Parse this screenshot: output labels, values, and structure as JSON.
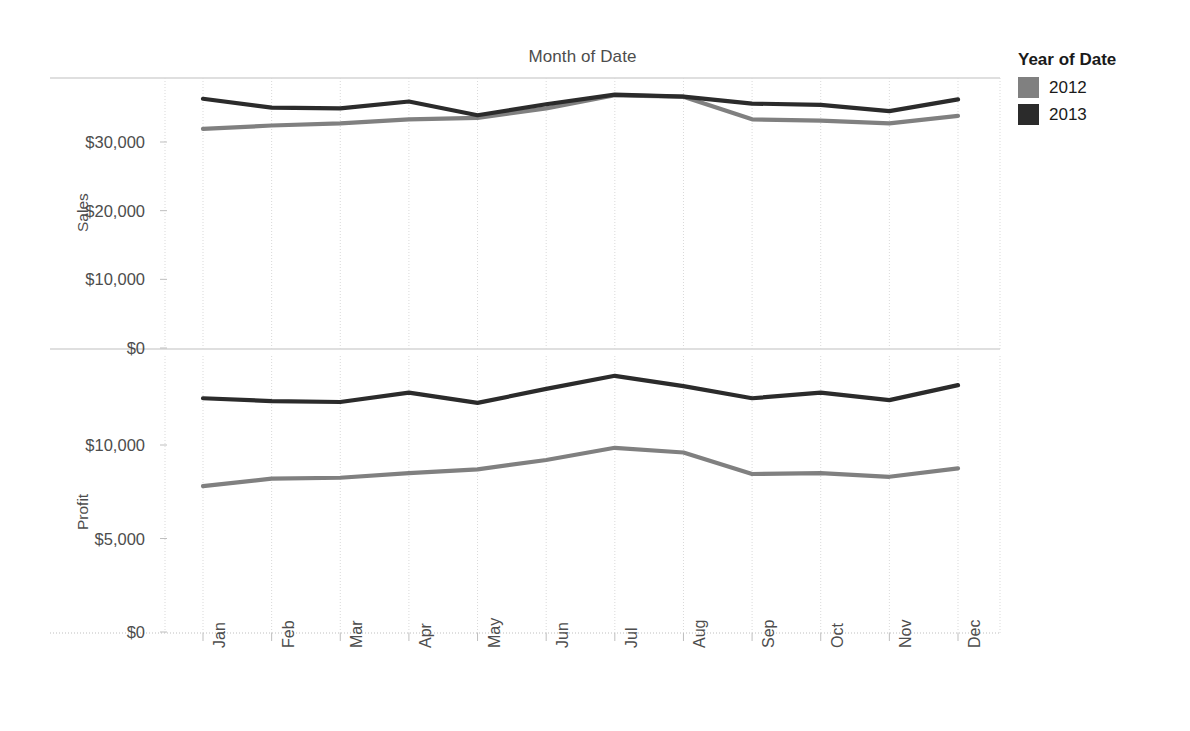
{
  "chart_data": {
    "type": "line",
    "title": "Month of Date",
    "xlabel": "",
    "panels": [
      {
        "name": "sales",
        "ylabel": "Sales",
        "ylim": [
          0,
          40000
        ],
        "yticks": [
          0,
          10000,
          20000,
          30000
        ],
        "ytick_labels": [
          "$0",
          "$10,000",
          "$20,000",
          "$30,000"
        ],
        "series": [
          {
            "name": "2012",
            "color": "#808080",
            "values": [
              31900,
              32400,
              32700,
              33300,
              33500,
              34900,
              36800,
              36600,
              33300,
              33100,
              32700,
              33800
            ]
          },
          {
            "name": "2013",
            "color": "#2b2b2b",
            "values": [
              36300,
              35000,
              34900,
              35900,
              33900,
              35500,
              36900,
              36600,
              35600,
              35400,
              34500,
              36200
            ]
          }
        ]
      },
      {
        "name": "profit",
        "ylabel": "Profit",
        "ylim": [
          0,
          15000
        ],
        "yticks": [
          0,
          5000,
          10000
        ],
        "ytick_labels": [
          "$0",
          "$5,000",
          "$10,000"
        ],
        "series": [
          {
            "name": "2012",
            "color": "#808080",
            "values": [
              7800,
              8200,
              8250,
              8500,
              8700,
              9200,
              9850,
              9600,
              8450,
              8500,
              8300,
              8750
            ]
          },
          {
            "name": "2013",
            "color": "#2b2b2b",
            "values": [
              12500,
              12350,
              12300,
              12800,
              12250,
              13000,
              13700,
              13150,
              12500,
              12800,
              12400,
              13200
            ]
          }
        ]
      }
    ],
    "categories": [
      "Jan",
      "Feb",
      "Mar",
      "Apr",
      "May",
      "Jun",
      "Jul",
      "Aug",
      "Sep",
      "Oct",
      "Nov",
      "Dec"
    ],
    "legend": {
      "title": "Year of Date",
      "position": "right",
      "entries": [
        {
          "label": "2012",
          "color": "#808080"
        },
        {
          "label": "2013",
          "color": "#2b2b2b"
        }
      ]
    },
    "grid": true
  },
  "colors": {
    "series_2012": "#808080",
    "series_2013": "#2b2b2b",
    "grid": "#d9d9d9",
    "axis": "#bfbfbf",
    "text": "#4d4d4d"
  }
}
